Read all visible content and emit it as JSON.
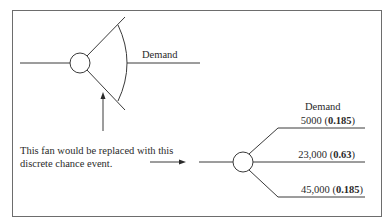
{
  "left_diagram": {
    "fan_label": "Demand"
  },
  "annotation": {
    "line1": "This fan would be replaced with this",
    "line2": "discrete chance event."
  },
  "right_diagram": {
    "header": "Demand",
    "branches": [
      {
        "value": "5000",
        "probability": "0.185"
      },
      {
        "value": "23,000",
        "probability": "0.63"
      },
      {
        "value": "45,000",
        "probability": "0.185"
      }
    ]
  },
  "colors": {
    "line": "#3a3a3a",
    "border": "#6d6d6d"
  }
}
